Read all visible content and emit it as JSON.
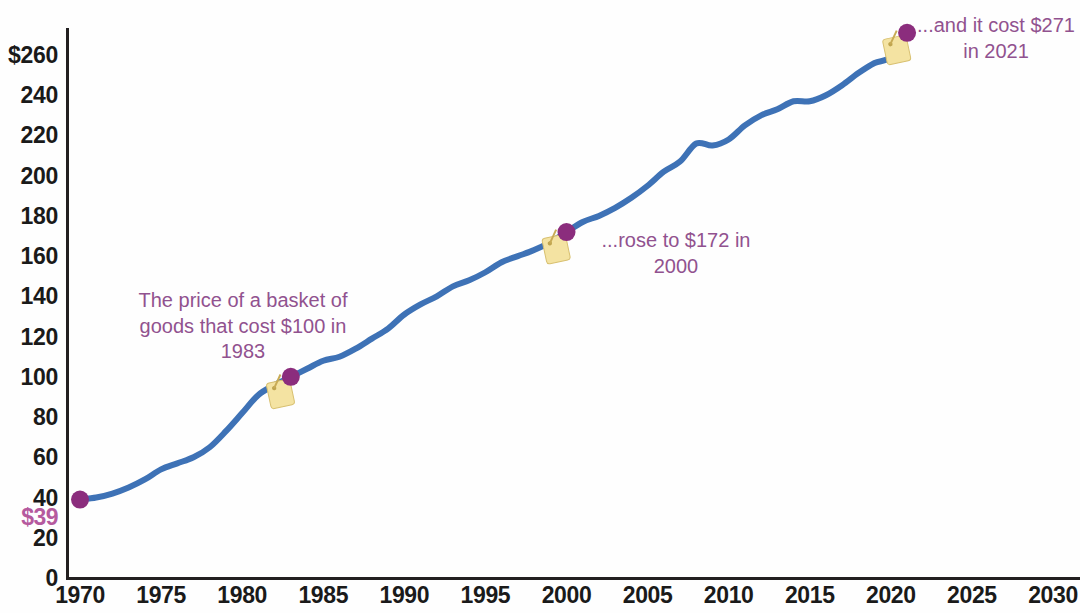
{
  "chart_data": {
    "type": "line",
    "title": "",
    "xlabel": "",
    "ylabel": "",
    "xlim": [
      1970,
      2030
    ],
    "ylim": [
      0,
      260
    ],
    "grid": false,
    "legend": "none",
    "x_ticks": [
      "1970",
      "1975",
      "1980",
      "1985",
      "1990",
      "1995",
      "2000",
      "2005",
      "2010",
      "2015",
      "2020",
      "2025",
      "2030"
    ],
    "y_ticks": [
      "$260",
      "240",
      "220",
      "200",
      "180",
      "160",
      "140",
      "120",
      "100",
      "80",
      "60",
      "40",
      "20",
      "0"
    ],
    "series": [
      {
        "name": "Price of a basket of goods (1983 = $100)",
        "color": "#3e72b6",
        "x": [
          1970,
          1971,
          1972,
          1973,
          1974,
          1975,
          1976,
          1977,
          1978,
          1979,
          1980,
          1981,
          1982,
          1983,
          1984,
          1985,
          1986,
          1987,
          1988,
          1989,
          1990,
          1991,
          1992,
          1993,
          1994,
          1995,
          1996,
          1997,
          1998,
          1999,
          2000,
          2001,
          2002,
          2003,
          2004,
          2005,
          2006,
          2007,
          2008,
          2009,
          2010,
          2011,
          2012,
          2013,
          2014,
          2015,
          2016,
          2017,
          2018,
          2019,
          2020,
          2021
        ],
        "values": [
          39,
          40,
          42,
          45,
          49,
          54,
          57,
          60,
          65,
          73,
          82,
          91,
          96,
          100,
          104,
          108,
          110,
          114,
          119,
          124,
          131,
          136,
          140,
          145,
          148,
          152,
          157,
          160,
          163,
          167,
          172,
          177,
          180,
          184,
          189,
          195,
          202,
          207,
          216,
          215,
          218,
          225,
          230,
          233,
          237,
          237,
          240,
          245,
          251,
          256,
          259,
          271
        ]
      }
    ],
    "markers": [
      {
        "name": "start-marker",
        "x": 1970,
        "y": 39,
        "label": "$39"
      },
      {
        "name": "marker-1983",
        "x": 1983,
        "y": 100,
        "label": ""
      },
      {
        "name": "marker-2000",
        "x": 2000,
        "y": 172,
        "label": ""
      },
      {
        "name": "marker-2021",
        "x": 2021,
        "y": 271,
        "label": ""
      }
    ],
    "annotations": [
      {
        "name": "annotation-1983",
        "text": "The price of a basket of\ngoods that cost $100 in\n1983",
        "color": "#91528f"
      },
      {
        "name": "annotation-2000",
        "text": "...rose to $172 in\n2000",
        "color": "#91528f"
      },
      {
        "name": "annotation-2021",
        "text": "...and it cost $271\nin 2021",
        "color": "#91528f"
      }
    ],
    "marker_color": "#8b2d7d",
    "tag_color": "#f4e3a2",
    "axis_color": "#231f20"
  }
}
